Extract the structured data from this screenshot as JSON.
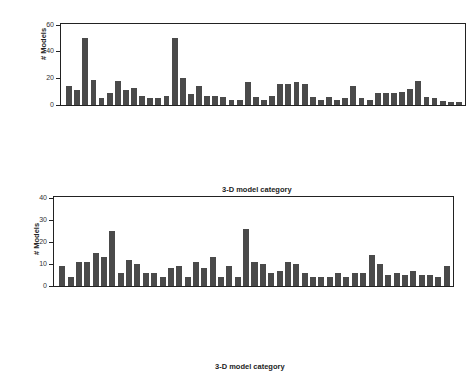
{
  "chart_data": [
    {
      "type": "bar",
      "title": "",
      "xlabel": "3-D model category",
      "ylabel": "# Models",
      "ylim": [
        0,
        60
      ],
      "yticks": [
        0,
        20,
        40,
        60
      ],
      "grid": false,
      "values": [
        14,
        11,
        50,
        19,
        5,
        9,
        18,
        11,
        13,
        7,
        5,
        5,
        7,
        50,
        20,
        8,
        14,
        7,
        7,
        6,
        4,
        4,
        17,
        6,
        4,
        7,
        16,
        16,
        17,
        16,
        6,
        4,
        6,
        4,
        5,
        14,
        5,
        4,
        9,
        9,
        9,
        10,
        12,
        18,
        6,
        5,
        3,
        2,
        2
      ]
    },
    {
      "type": "bar",
      "title": "",
      "xlabel": "3-D model category",
      "ylabel": "# Models",
      "ylim": [
        0,
        40
      ],
      "yticks": [
        0,
        10,
        20,
        30,
        40
      ],
      "grid": false,
      "values": [
        9,
        4,
        11,
        11,
        15,
        13,
        25,
        6,
        12,
        10,
        6,
        6,
        4,
        8,
        9,
        4,
        11,
        8,
        13,
        4,
        9,
        4,
        26,
        11,
        10,
        6,
        7,
        11,
        10,
        6,
        4,
        4,
        4,
        6,
        4,
        6,
        6,
        14,
        10,
        5,
        6,
        5,
        7,
        5,
        5,
        4,
        9
      ]
    }
  ]
}
